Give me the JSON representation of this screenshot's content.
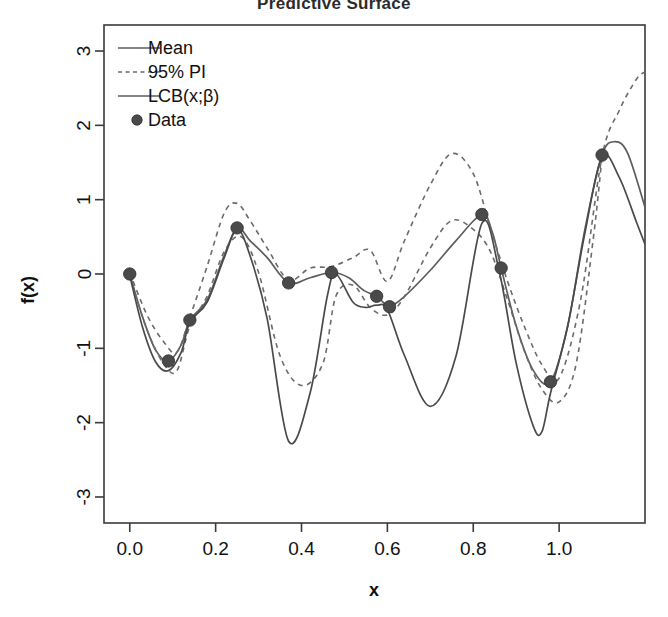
{
  "chart_data": {
    "type": "line",
    "title": "Predictive Surface",
    "xlabel": "x",
    "ylabel": "f(x)",
    "xlim": [
      -0.06,
      1.2
    ],
    "ylim": [
      -3.35,
      3.35
    ],
    "xticks": [
      0.0,
      0.2,
      0.4,
      0.6,
      0.8,
      1.0
    ],
    "xticklabels": [
      "0.0",
      "0.2",
      "0.4",
      "0.6",
      "0.8",
      "1.0"
    ],
    "yticks": [
      -3,
      -2,
      -1,
      0,
      1,
      2,
      3
    ],
    "yticklabels": [
      "-3",
      "-2",
      "-1",
      "0",
      "1",
      "2",
      "3"
    ],
    "grid": false,
    "legend_position": "top-left",
    "legend": [
      {
        "label": "Mean",
        "style": "solid",
        "marker": "none"
      },
      {
        "label": "95% PI",
        "style": "dashed",
        "marker": "none"
      },
      {
        "label": "LCB(x;β)",
        "style": "solid",
        "marker": "none"
      },
      {
        "label": "Data",
        "style": "none",
        "marker": "circle"
      }
    ],
    "data_points": {
      "name": "Data",
      "x": [
        0.0,
        0.09,
        0.14,
        0.25,
        0.37,
        0.47,
        0.575,
        0.605,
        0.82,
        0.865,
        0.98,
        1.1
      ],
      "y": [
        0.0,
        -1.17,
        -0.62,
        0.62,
        -0.12,
        0.02,
        -0.3,
        -0.44,
        0.8,
        0.08,
        -1.45,
        1.6
      ]
    },
    "series": [
      {
        "name": "Mean",
        "style": "solid",
        "x": [
          0.0,
          0.03,
          0.06,
          0.09,
          0.12,
          0.14,
          0.18,
          0.22,
          0.25,
          0.28,
          0.32,
          0.37,
          0.42,
          0.47,
          0.51,
          0.545,
          0.575,
          0.59,
          0.605,
          0.64,
          0.7,
          0.76,
          0.82,
          0.845,
          0.865,
          0.9,
          0.94,
          0.98,
          1.02,
          1.06,
          1.1,
          1.13,
          1.16,
          1.2
        ],
        "y": [
          0.0,
          -0.58,
          -1.02,
          -1.17,
          -0.95,
          -0.62,
          -0.35,
          0.25,
          0.62,
          0.45,
          0.22,
          -0.12,
          -0.05,
          0.02,
          -0.05,
          -0.22,
          -0.3,
          -0.38,
          -0.44,
          -0.3,
          0.05,
          0.45,
          0.8,
          0.55,
          0.08,
          -0.7,
          -1.3,
          -1.45,
          -0.7,
          0.6,
          1.6,
          1.78,
          1.62,
          0.9
        ]
      },
      {
        "name": "95% PI upper",
        "style": "dashed",
        "x": [
          0.0,
          0.04,
          0.08,
          0.11,
          0.14,
          0.18,
          0.22,
          0.25,
          0.28,
          0.32,
          0.37,
          0.42,
          0.47,
          0.52,
          0.56,
          0.6,
          0.64,
          0.7,
          0.75,
          0.8,
          0.84,
          0.88,
          0.92,
          0.96,
          1.0,
          1.05,
          1.1,
          1.14,
          1.18,
          1.2
        ],
        "y": [
          0.02,
          -0.55,
          -0.92,
          -1.05,
          -0.58,
          0.1,
          0.82,
          0.95,
          0.72,
          0.35,
          -0.08,
          0.08,
          0.1,
          0.22,
          0.32,
          -0.1,
          0.45,
          1.2,
          1.62,
          1.35,
          0.62,
          -0.1,
          -0.72,
          -1.22,
          -1.4,
          -0.35,
          1.58,
          2.2,
          2.62,
          2.72
        ]
      },
      {
        "name": "95% PI lower",
        "style": "dashed",
        "x": [
          0.0,
          0.04,
          0.08,
          0.11,
          0.14,
          0.18,
          0.22,
          0.26,
          0.3,
          0.35,
          0.4,
          0.45,
          0.48,
          0.52,
          0.56,
          0.6,
          0.64,
          0.7,
          0.75,
          0.8,
          0.84,
          0.88,
          0.92,
          0.96,
          1.0,
          1.04,
          1.08,
          1.1
        ],
        "y": [
          -0.02,
          -0.75,
          -1.22,
          -1.3,
          -0.7,
          -0.3,
          0.3,
          0.5,
          0.02,
          -1.1,
          -1.5,
          -1.2,
          -0.3,
          -0.15,
          -0.45,
          -0.55,
          -0.3,
          0.35,
          0.72,
          0.6,
          0.3,
          -0.35,
          -1.05,
          -1.55,
          -1.72,
          -1.2,
          0.5,
          1.58
        ]
      },
      {
        "name": "LCB(x;β)",
        "style": "solid",
        "x": [
          0.0,
          0.03,
          0.06,
          0.09,
          0.12,
          0.14,
          0.18,
          0.22,
          0.25,
          0.28,
          0.32,
          0.37,
          0.42,
          0.46,
          0.48,
          0.52,
          0.55,
          0.575,
          0.6,
          0.64,
          0.7,
          0.76,
          0.82,
          0.86,
          0.9,
          0.94,
          0.96,
          0.98,
          1.02,
          1.06,
          1.1,
          1.14,
          1.18,
          1.2
        ],
        "y": [
          -0.02,
          -0.72,
          -1.18,
          -1.3,
          -1.05,
          -0.65,
          -0.38,
          0.22,
          0.6,
          0.25,
          -0.6,
          -2.25,
          -1.6,
          -0.3,
          0.0,
          -0.38,
          -0.45,
          -0.42,
          -0.48,
          -1.1,
          -1.78,
          -1.1,
          0.68,
          0.05,
          -1.2,
          -2.05,
          -2.12,
          -1.6,
          -0.7,
          0.55,
          1.58,
          1.3,
          0.7,
          0.4
        ]
      }
    ]
  },
  "colors": {
    "mean_line": "#5d5d5d",
    "pi_line": "#6b6b6b",
    "lcb_line": "#4a4a4a",
    "point_fill": "#4a4a4a",
    "frame": "#3a3a3a",
    "background": "#ffffff"
  }
}
